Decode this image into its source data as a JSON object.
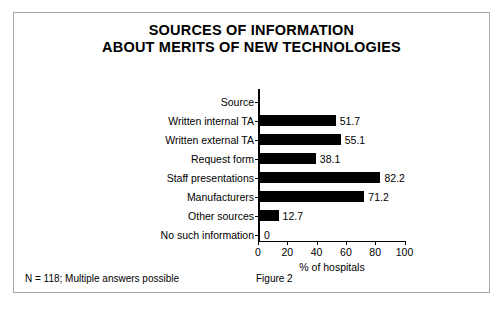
{
  "figure": {
    "title_line1": "SOURCES OF INFORMATION",
    "title_line2": "ABOUT MERITS OF NEW TECHNOLOGIES",
    "footer_note": "N = 118; Multiple answers possible",
    "figure_number": "Figure 2",
    "frame_color": "#a9a9a9",
    "bar_color": "#000000",
    "background_color": "#ffffff"
  },
  "chart_data": {
    "type": "bar",
    "orientation": "horizontal",
    "title": "SOURCES OF INFORMATION ABOUT MERITS OF NEW TECHNOLOGIES",
    "categories": [
      "Source",
      "Written internal TA",
      "Written external TA",
      "Request form",
      "Staff presentations",
      "Manufacturers",
      "Other sources",
      "No such information"
    ],
    "values": [
      null,
      51.7,
      55.1,
      38.1,
      82.2,
      71.2,
      12.7,
      0
    ],
    "value_labels": [
      "",
      "51.7",
      "55.1",
      "38.1",
      "82.2",
      "71.2",
      "12.7",
      "0"
    ],
    "xlabel": "% of hospitals",
    "ylabel": "",
    "xlim": [
      0,
      100
    ],
    "xticks": [
      0,
      20,
      40,
      60,
      80,
      100
    ],
    "xtick_labels": [
      "0",
      "20",
      "40",
      "60",
      "80",
      "100"
    ],
    "grid": false,
    "legend": false,
    "note": "N = 118; Multiple answers possible"
  }
}
